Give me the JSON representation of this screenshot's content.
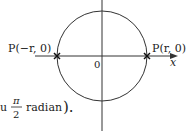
{
  "diagram": {
    "points": {
      "left_label": "P(−r, 0)",
      "right_label": "P(r, 0)"
    },
    "origin_label": "0",
    "x_axis_label": "x",
    "caption": {
      "prefix": "u",
      "fraction_num": "π",
      "fraction_den": "2",
      "suffix": "radian",
      "close": ")."
    }
  }
}
